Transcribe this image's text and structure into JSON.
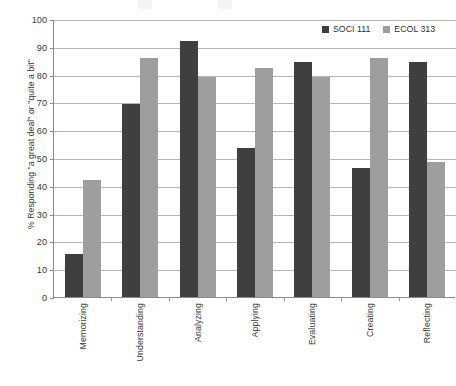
{
  "chart_data": {
    "type": "bar",
    "title": "",
    "xlabel": "",
    "ylabel": "% Responding \"a great deal\" or \"quite a bit\"",
    "categories": [
      "Memorizing",
      "Understanding",
      "Analyzing",
      "Applying",
      "Evaluating",
      "Creating",
      "Reflecting"
    ],
    "series": [
      {
        "name": "SOCI 111",
        "color": "#3f3f3f",
        "values": [
          15.5,
          69.5,
          92,
          53.5,
          84.5,
          46.5,
          84.5
        ]
      },
      {
        "name": "ECOL 313",
        "color": "#9e9e9e",
        "values": [
          42,
          86,
          79,
          82.5,
          79,
          86,
          48.5
        ]
      }
    ],
    "ylim": [
      0,
      100
    ],
    "ytick_step": 10,
    "ytick_labels": [
      "100",
      "90",
      "80",
      "70",
      "60",
      "50",
      "40",
      "30",
      "20",
      "10",
      "0"
    ],
    "grid": true,
    "legend_position": "top-right"
  },
  "axis": {
    "y_title": "% Responding \"a great deal\" or \"quite a bit\""
  }
}
